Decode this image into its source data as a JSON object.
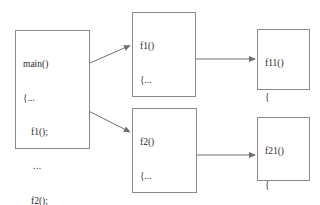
{
  "diagram": {
    "line_color": "#8a8a8a",
    "text_color": "#2b2b2b",
    "background": "#ffffff",
    "boxes": [
      {
        "id": "main",
        "name": "main",
        "lines": [
          "main()",
          "{...",
          "f1();",
          "...",
          "f2();",
          "...",
          "}"
        ]
      },
      {
        "id": "f1",
        "name": "f1",
        "lines": [
          "f1()",
          "{...",
          "f11();",
          "...",
          "}"
        ]
      },
      {
        "id": "f11",
        "name": "f11",
        "lines": [
          "f11()",
          "{",
          "...",
          "}"
        ]
      },
      {
        "id": "f2",
        "name": "f2",
        "lines": [
          "f2()",
          "{...",
          "f21();",
          "...",
          "}"
        ]
      },
      {
        "id": "f21",
        "name": "f21",
        "lines": [
          "f21()",
          "{",
          "...",
          "}"
        ]
      }
    ],
    "arrows": [
      {
        "id": "main-to-f1",
        "from": "main",
        "to": "f1",
        "label": ""
      },
      {
        "id": "main-to-f2",
        "from": "main",
        "to": "f2",
        "label": ""
      },
      {
        "id": "f1-to-f11",
        "from": "f1",
        "to": "f11",
        "label": ""
      },
      {
        "id": "f2-to-f21",
        "from": "f2",
        "to": "f21",
        "label": ""
      }
    ]
  }
}
